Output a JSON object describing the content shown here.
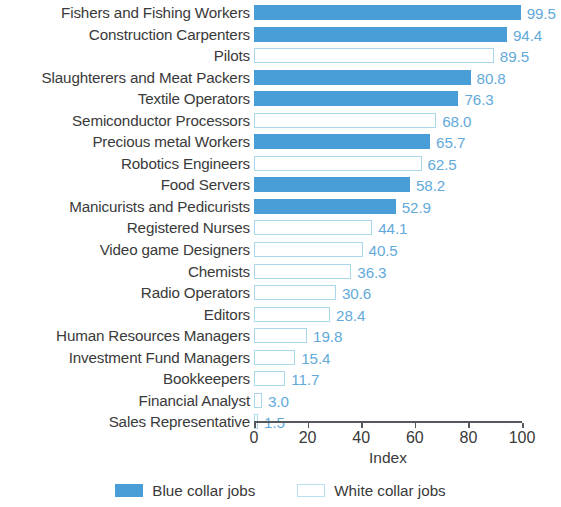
{
  "chart_data": {
    "type": "bar",
    "orientation": "horizontal",
    "title": "",
    "xlabel": "Index",
    "ylabel": "",
    "xlim": [
      0,
      100
    ],
    "xticks": [
      0,
      20,
      40,
      60,
      80,
      100
    ],
    "grid": false,
    "legend_position": "bottom",
    "categories": [
      "Fishers and Fishing Workers",
      "Construction Carpenters",
      "Pilots",
      "Slaughterers and Meat Packers",
      "Textile Operators",
      "Semiconductor Processors",
      "Precious metal Workers",
      "Robotics Engineers",
      "Food Servers",
      "Manicurists and Pedicurists",
      "Registered Nurses",
      "Video game Designers",
      "Chemists",
      "Radio Operators",
      "Editors",
      "Human Resources Managers",
      "Investment Fund Managers",
      "Bookkeepers",
      "Financial Analyst",
      "Sales Representative"
    ],
    "values": [
      99.5,
      94.4,
      89.5,
      80.8,
      76.3,
      68.0,
      65.7,
      62.5,
      58.2,
      52.9,
      44.1,
      40.5,
      36.3,
      30.6,
      28.4,
      19.8,
      15.4,
      11.7,
      3.0,
      1.5
    ],
    "value_labels": [
      "99.5",
      "94.4",
      "89.5",
      "80.8",
      "76.3",
      "68.0",
      "65.7",
      "62.5",
      "58.2",
      "52.9",
      "44.1",
      "40.5",
      "36.3",
      "30.6",
      "28.4",
      "19.8",
      "15.4",
      "11.7",
      "3.0",
      "1.5"
    ],
    "groups": [
      "blue",
      "blue",
      "white",
      "blue",
      "blue",
      "white",
      "blue",
      "white",
      "blue",
      "blue",
      "white",
      "white",
      "white",
      "white",
      "white",
      "white",
      "white",
      "white",
      "white",
      "white"
    ],
    "legend": [
      {
        "label": "Blue collar jobs",
        "key": "blue",
        "color": "#4a9ed8"
      },
      {
        "label": "White collar jobs",
        "key": "white",
        "color": "#ffffff"
      }
    ],
    "colors": {
      "blue_collar": "#4a9ed8",
      "white_collar_fill": "#ffffff",
      "white_collar_border": "#a9d8ed",
      "value_label": "#63aada",
      "category_label": "#3a3a3a",
      "axis": "#55585c"
    }
  },
  "axis": {
    "tick_labels": [
      "0",
      "20",
      "40",
      "60",
      "80",
      "100"
    ],
    "title": "Index"
  }
}
